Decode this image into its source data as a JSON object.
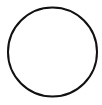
{
  "canvas": {
    "width": 102,
    "height": 105,
    "viewbox": "0 0 102 105",
    "background": "#ffffff"
  },
  "circle": {
    "cx": 52.5,
    "cy": 52,
    "r": 44.5,
    "stroke": "#111111",
    "stroke_width": 2,
    "fill": "none"
  }
}
